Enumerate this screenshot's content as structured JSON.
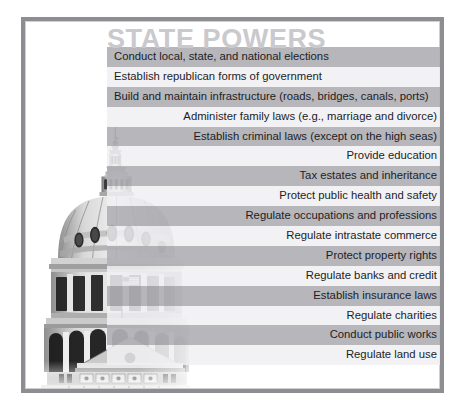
{
  "figure": {
    "title": "STATE POWERS",
    "title_color": "#c9c9ce",
    "frame_color": "#8d8d92",
    "band_dark_color": "#b0b0b5",
    "band_light_color": "#f0f0f2",
    "text_color": "#1d1d26",
    "background_color": "#ffffff"
  },
  "artwork": {
    "name": "state-capitol-dome-photo",
    "description": "Grayscale photograph of a state capitol building dome with flag"
  },
  "powers": [
    {
      "label": "Conduct local, state, and national elections",
      "shade": "dark",
      "align": "left"
    },
    {
      "label": "Establish republican forms of government",
      "shade": "light",
      "align": "left"
    },
    {
      "label": "Build and maintain infrastructure (roads, bridges, canals, ports)",
      "shade": "dark",
      "align": "left"
    },
    {
      "label": "Administer family laws (e.g., marriage and divorce)",
      "shade": "light",
      "align": "right"
    },
    {
      "label": "Establish criminal laws (except on the high seas)",
      "shade": "dark",
      "align": "right"
    },
    {
      "label": "Provide education",
      "shade": "light",
      "align": "right"
    },
    {
      "label": "Tax estates and inheritance",
      "shade": "dark",
      "align": "right"
    },
    {
      "label": "Protect public health and safety",
      "shade": "light",
      "align": "right"
    },
    {
      "label": "Regulate occupations and professions",
      "shade": "dark",
      "align": "right"
    },
    {
      "label": "Regulate intrastate commerce",
      "shade": "light",
      "align": "right"
    },
    {
      "label": "Protect property rights",
      "shade": "dark",
      "align": "right"
    },
    {
      "label": "Regulate banks and credit",
      "shade": "light",
      "align": "right"
    },
    {
      "label": "Establish insurance laws",
      "shade": "dark",
      "align": "right"
    },
    {
      "label": "Regulate charities",
      "shade": "light",
      "align": "right"
    },
    {
      "label": "Conduct public works",
      "shade": "dark",
      "align": "right"
    },
    {
      "label": "Regulate land use",
      "shade": "light",
      "align": "right"
    }
  ]
}
